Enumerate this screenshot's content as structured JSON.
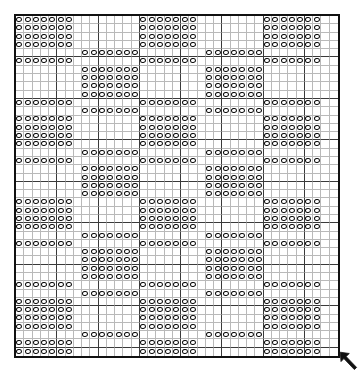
{
  "document": {
    "kind": "filet-crochet-chart",
    "title": "Filet crochet grid chart",
    "description": "Checkerboard diaper pattern worked in open and filled mesh squares"
  },
  "chart_data": {
    "type": "heatmap",
    "xlabel": "",
    "ylabel": "",
    "columns": 39,
    "rows": 41,
    "grid": true,
    "legend": [
      {
        "key": "on",
        "symbol": "circle",
        "label": "filled mesh square",
        "color": "#0b0b0b"
      },
      {
        "key": "off",
        "symbol": "blank",
        "label": "open mesh square",
        "color": "#ffffff"
      }
    ],
    "cell_symbol": "circle",
    "grid_line_color": "#b9b9b9",
    "major_grid_line_color": "#3a3a3a",
    "border_color": "#111111",
    "major_every": 5,
    "matrix": [
      "111111100000000111111100000000111111100",
      "111111100000000111111100000000111111100",
      "111111100000000111111100000000111111100",
      "111111100000000111111100000000111111100",
      "000000001111111000000001111111000000000",
      "111111100000000111111100000000111111100",
      "000000001111111000000001111111000000000",
      "000000001111111000000001111111000000000",
      "000000001111111000000001111111000000000",
      "000000001111111000000001111111000000000",
      "111111100000000111111100000000111111100",
      "000000001111111000000001111111000000000",
      "111111100000000111111100000000111111100",
      "111111100000000111111100000000111111100",
      "111111100000000111111100000000111111100",
      "111111100000000111111100000000111111100",
      "000000001111111000000001111111000000000",
      "111111100000000111111100000000111111100",
      "000000001111111000000001111111000000000",
      "000000001111111000000001111111000000000",
      "000000001111111000000001111111000000000",
      "000000001111111000000001111111000000000",
      "111111100000000111111100000000111111100",
      "111111100000000111111100000000111111100",
      "111111100000000111111100000000111111100",
      "111111100000000111111100000000111111100",
      "000000001111111000000001111111000000000",
      "111111100000000111111100000000111111100",
      "000000001111111000000001111111000000000",
      "000000001111111000000001111111000000000",
      "000000001111111000000001111111000000000",
      "000000001111111000000001111111000000000",
      "111111100000000111111100000000111111100",
      "000000001111111000000001111111000000000",
      "111111100000000111111100000000111111100",
      "111111100000000111111100000000111111100",
      "111111100000000111111100000000111111100",
      "111111100000000111111100000000111111100",
      "000000001111111000000001111111000000000",
      "111111100000000111111100000000111111100",
      "111111100000000111111100000000111111100"
    ]
  },
  "annotations": {
    "start_arrow": {
      "name": "start-direction-arrow",
      "glyph": "arrow-up-left",
      "label": "",
      "color": "#111111",
      "position": "bottom-right"
    }
  }
}
